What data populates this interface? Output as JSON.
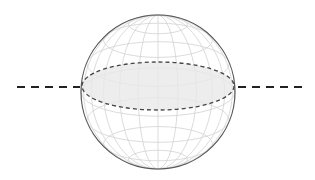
{
  "diagram": {
    "title": "",
    "canvas": {
      "width": 315,
      "height": 180,
      "background": "#ffffff"
    },
    "sphere": {
      "cx": 158,
      "cy": 92,
      "r": 77,
      "stroke": "#555555",
      "grid_color": "#d2d2d2",
      "meridians": 12,
      "parallels": 8
    },
    "equator_plane": {
      "cx": 158,
      "cy": 86,
      "rx": 76,
      "ry": 24,
      "stroke": "#444444",
      "fill": "#e9e9e9",
      "dash": "4 3"
    },
    "axis_line": {
      "y": 87,
      "left": {
        "x1": 17,
        "x2": 80
      },
      "right": {
        "x1": 238,
        "x2": 302
      },
      "stroke": "#222222",
      "dash": "8 6",
      "width": 2
    }
  }
}
